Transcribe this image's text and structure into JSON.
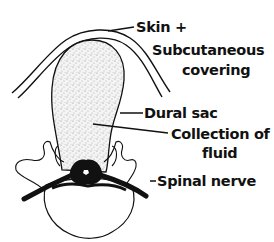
{
  "diagram": {
    "labels": {
      "skin_line1": "Skin  +",
      "skin_line2": "Subcutaneous",
      "skin_line3": "covering",
      "dural_sac": "Dural  sac",
      "fluid_line1": "Collection  of",
      "fluid_line2": "fluid",
      "spinal_nerve": "Spinal  nerve"
    },
    "colors": {
      "ink": "#111111",
      "background": "#ffffff",
      "fluid_stipple": "#9a9a9a"
    }
  }
}
